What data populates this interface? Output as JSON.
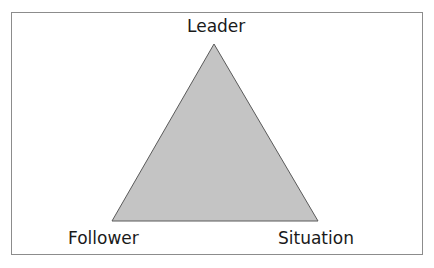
{
  "diagram": {
    "type": "triangle",
    "vertices": {
      "top": {
        "label": "Leader"
      },
      "bottom_left": {
        "label": "Follower"
      },
      "bottom_right": {
        "label": "Situation"
      }
    },
    "colors": {
      "fill": "#c4c4c4",
      "stroke": "#5a5a5a",
      "frame_border": "#8c8c8c",
      "text": "#1a1a1a",
      "background": "#ffffff"
    }
  }
}
